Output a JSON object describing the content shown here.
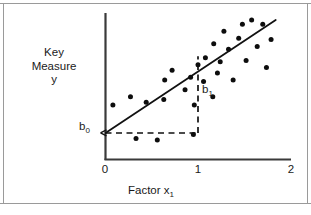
{
  "figure": {
    "background_color": "#ffffff",
    "ink_color": "#111111",
    "axis_color": "#3a3a3a",
    "frame_color": "#9a9a9a"
  },
  "labels": {
    "y_axis_title": "Key Measure y",
    "y_axis_title_lines": [
      "Key",
      "Measure",
      "y"
    ],
    "x_axis_title_base": "Factor x",
    "x_axis_title_sub": "1",
    "intercept_base": "b",
    "intercept_sub": "0",
    "slope_base": "b",
    "slope_sub": "1"
  },
  "chart_data": {
    "type": "scatter",
    "title": "",
    "xlabel": "Factor x1",
    "ylabel": "Key Measure y",
    "xlim": [
      0,
      2
    ],
    "ylim": [
      0,
      1
    ],
    "xticks": [
      0,
      1,
      2
    ],
    "xtick_labels": [
      "0",
      "1",
      "2"
    ],
    "yticks": [],
    "ytick_labels": [],
    "grid": false,
    "legend": false,
    "annotations": [
      {
        "text": "b0",
        "meaning": "intercept of fitted line at x = 0",
        "x": 0,
        "y": 0.19
      },
      {
        "text": "b1",
        "meaning": "slope: rise of fitted line over one unit of x",
        "x": 1,
        "y": 0.46
      }
    ],
    "fit_line": {
      "label": "least-squares fit",
      "intercept": 0.19,
      "slope": 0.55,
      "x_start": 0.0,
      "x_end": 1.84,
      "y_start": 0.19,
      "y_end": 1.0
    },
    "reference_lines": [
      {
        "name": "horizontal-run-guide",
        "style": "dashed",
        "from": [
          0,
          0.19
        ],
        "to": [
          1,
          0.19
        ]
      },
      {
        "name": "vertical-rise-guide",
        "style": "dashed",
        "from": [
          1,
          0.19
        ],
        "to": [
          1,
          0.74
        ]
      }
    ],
    "points": [
      {
        "x": 0.08,
        "y": 0.39
      },
      {
        "x": 0.27,
        "y": 0.45
      },
      {
        "x": 0.33,
        "y": 0.15
      },
      {
        "x": 0.44,
        "y": 0.41
      },
      {
        "x": 0.56,
        "y": 0.14
      },
      {
        "x": 0.63,
        "y": 0.43
      },
      {
        "x": 0.64,
        "y": 0.57
      },
      {
        "x": 0.72,
        "y": 0.64
      },
      {
        "x": 0.86,
        "y": 0.5
      },
      {
        "x": 0.92,
        "y": 0.59
      },
      {
        "x": 0.95,
        "y": 0.18
      },
      {
        "x": 0.96,
        "y": 0.39
      },
      {
        "x": 1.0,
        "y": 0.68
      },
      {
        "x": 1.06,
        "y": 0.56
      },
      {
        "x": 1.08,
        "y": 0.73
      },
      {
        "x": 1.16,
        "y": 0.45
      },
      {
        "x": 1.17,
        "y": 0.83
      },
      {
        "x": 1.21,
        "y": 0.62
      },
      {
        "x": 1.24,
        "y": 0.7
      },
      {
        "x": 1.28,
        "y": 0.92
      },
      {
        "x": 1.33,
        "y": 0.79
      },
      {
        "x": 1.38,
        "y": 0.57
      },
      {
        "x": 1.44,
        "y": 0.87
      },
      {
        "x": 1.48,
        "y": 0.97
      },
      {
        "x": 1.52,
        "y": 0.71
      },
      {
        "x": 1.58,
        "y": 1.0
      },
      {
        "x": 1.64,
        "y": 0.81
      },
      {
        "x": 1.7,
        "y": 0.97
      },
      {
        "x": 1.74,
        "y": 0.66
      },
      {
        "x": 1.79,
        "y": 0.86
      }
    ]
  }
}
